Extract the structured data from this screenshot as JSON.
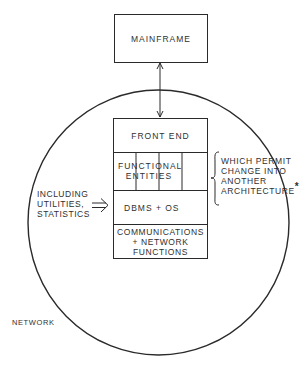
{
  "diagram": {
    "mainframe": {
      "label": "MAINFRAME"
    },
    "network": {
      "label": "NETWORK"
    },
    "stack": {
      "front_end": {
        "label": "FRONT END"
      },
      "functional_entities": {
        "label_line1": "FUNCTIONAL",
        "label_line2": "ENTITIES"
      },
      "dbms_os": {
        "label": "DBMS + OS"
      },
      "communications": {
        "label_line1": "COMMUNICATIONS",
        "label_line2": "+ NETWORK",
        "label_line3": "FUNCTIONS"
      }
    },
    "annotations": {
      "right_note": {
        "line1": "WHICH PERMIT",
        "line2": "CHANGE INTO",
        "line3": "ANOTHER",
        "line4": "ARCHITECTURE",
        "marker": "*"
      },
      "left_note": {
        "line1": "INCLUDING",
        "line2": "UTILITIES,",
        "line3": "STATISTICS",
        "arrow": "⇒"
      }
    },
    "connections": [
      {
        "from": "mainframe",
        "to": "front_end",
        "type": "bidirectional-arrow"
      }
    ],
    "colors": {
      "line": "#2a2a2a",
      "background": "#ffffff"
    }
  }
}
